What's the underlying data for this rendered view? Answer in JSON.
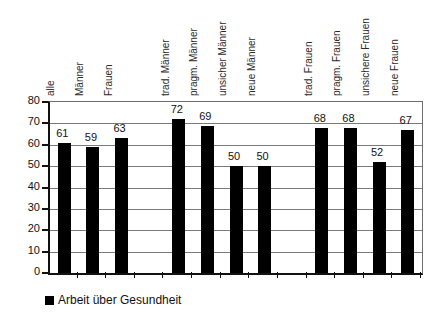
{
  "chart_data": {
    "type": "bar",
    "title": "",
    "subtitle": "",
    "xlabel": "",
    "ylabel": "",
    "ylim": [
      0,
      80
    ],
    "ytick_values": [
      0,
      10,
      20,
      30,
      40,
      50,
      60,
      70,
      80
    ],
    "ytick_labels": [
      "0",
      "10",
      "20",
      "30",
      "40",
      "50",
      "60",
      "70",
      "80"
    ],
    "grid": true,
    "legend_position": "bottom-left",
    "bar_color": "#000000",
    "categories": [
      "alle",
      "Männer",
      "Frauen",
      "",
      "trad. Männer",
      "pragm. Männer",
      "unsicher Männer",
      "neue Männer",
      "",
      "trad. Frauen",
      "pragm. Frauen",
      "unsichere Frauen",
      "neue Frauen"
    ],
    "series": [
      {
        "name": "Arbeit über Gesundheit",
        "values": [
          61,
          59,
          63,
          null,
          72,
          69,
          50,
          50,
          null,
          68,
          68,
          52,
          67
        ]
      }
    ],
    "data_labels": [
      "61",
      "59",
      "63",
      "",
      "72",
      "69",
      "50",
      "50",
      "",
      "68",
      "68",
      "52",
      "67"
    ]
  },
  "legend": {
    "items": [
      {
        "label": "Arbeit über Gesundheit",
        "color": "#000000"
      }
    ]
  }
}
